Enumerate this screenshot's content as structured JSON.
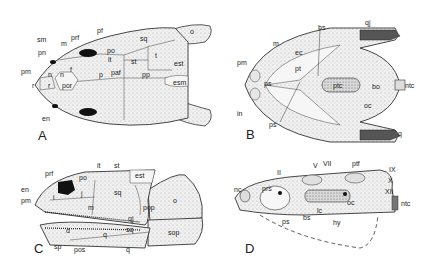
{
  "figure": {
    "panels": [
      {
        "id": "A",
        "view": "dorsal",
        "letter": "A",
        "labels": [
          "sm",
          "pn",
          "pm",
          "r",
          "en",
          "m",
          "prf",
          "pf",
          "n",
          "n",
          "r",
          "f",
          "por",
          "po",
          "it",
          "p",
          "paf",
          "sq",
          "st",
          "t",
          "pp",
          "est",
          "esm",
          "o"
        ]
      },
      {
        "id": "B",
        "view": "ventral",
        "letter": "B",
        "labels": [
          "bs",
          "qj",
          "m",
          "ec",
          "pm",
          "pt",
          "ps",
          "ptc",
          "bo",
          "ntc",
          "in",
          "ps",
          "oc",
          "q"
        ]
      },
      {
        "id": "C",
        "view": "lateral",
        "letter": "C",
        "labels": [
          "it",
          "st",
          "prf",
          "po",
          "est",
          "en",
          "pm",
          "l",
          "j",
          "sq",
          "m",
          "pop",
          "o",
          "qj",
          "sq",
          "d",
          "q",
          "sp",
          "pos",
          "q",
          "sop"
        ]
      },
      {
        "id": "D",
        "view": "neurocranium lateral",
        "letter": "D",
        "labels": [
          "V",
          "VII",
          "ptf",
          "IX",
          "II",
          "X",
          "XII",
          "nc",
          "prs",
          "oc",
          "ntc",
          "ps",
          "bs",
          "lc",
          "hy"
        ]
      }
    ]
  },
  "A": {
    "letter": "A",
    "sm": "sm",
    "pn": "pn",
    "pm": "pm",
    "r": "r",
    "en": "en",
    "m": "m",
    "prf": "prf",
    "pf": "pf",
    "n1": "n",
    "n2": "n",
    "r2": "r",
    "f1": "f",
    "f2": "f",
    "por": "por",
    "po": "po",
    "it": "it",
    "p": "p",
    "paf": "paf",
    "sq": "sq",
    "st": "st",
    "t": "t",
    "pp": "pp",
    "est": "est",
    "esm": "esm",
    "o": "o"
  },
  "B": {
    "letter": "B",
    "bs": "bs",
    "qj": "qj",
    "m": "m",
    "ec": "ec",
    "pm": "pm",
    "pt": "pt",
    "ps1": "ps",
    "ptc": "ptc",
    "bo": "bo",
    "ntc": "ntc",
    "in": "in",
    "ps2": "ps",
    "oc": "oc",
    "q": "q"
  },
  "C": {
    "letter": "C",
    "it": "it",
    "st": "st",
    "prf": "prf",
    "po": "po",
    "est": "est",
    "en": "en",
    "pm": "pm",
    "l": "l",
    "j": "j",
    "sq": "sq",
    "m": "m",
    "pop": "pop",
    "o": "o",
    "qj": "qj",
    "sq2": "sq",
    "d": "d",
    "q1": "q",
    "sp": "sp",
    "pos": "pos",
    "q2": "q",
    "sop": "sop"
  },
  "D": {
    "letter": "D",
    "V": "V",
    "VII": "VII",
    "ptf": "ptf",
    "IX": "IX",
    "II": "II",
    "X": "X",
    "XII": "XII",
    "nc": "nc",
    "prs": "prs",
    "oc": "oc",
    "ntc": "ntc",
    "ps": "ps",
    "bs": "bs",
    "lc": "lc",
    "hy": "hy"
  }
}
